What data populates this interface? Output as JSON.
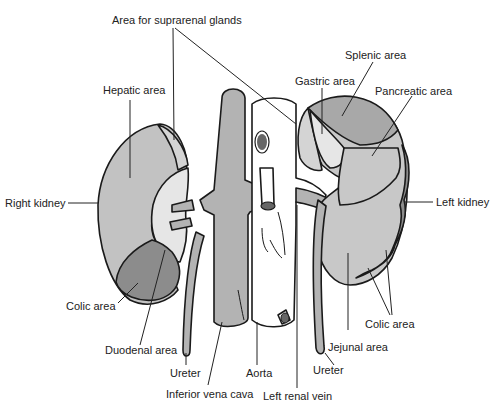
{
  "colors": {
    "kidney": "#c2c2c2",
    "vena_cava": "#b3b3b3",
    "colic": "#8c8c8c",
    "splenic": "#a8a8a8",
    "pancreatic": "#c8c8c8",
    "light_area": "#e6e6e6",
    "aorta": "#ffffff",
    "outline": "#1a1a1a"
  },
  "labels": {
    "suprarenal": "Area for suprarenal glands",
    "hepatic": "Hepatic area",
    "splenic": "Splenic area",
    "gastric": "Gastric area",
    "pancreatic": "Pancreatic area",
    "right_kidney": "Right kidney",
    "left_kidney": "Left kidney",
    "colic_right": "Colic area",
    "colic_left": "Colic area",
    "duodenal": "Duodenal area",
    "jejunal": "Jejunal area",
    "ureter_right": "Ureter",
    "ureter_left": "Ureter",
    "ivc": "Inferior vena cava",
    "aorta": "Aorta",
    "left_renal_vein": "Left renal vein"
  }
}
